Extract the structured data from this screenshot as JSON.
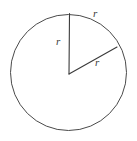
{
  "figure": {
    "kind": "geometry-diagram",
    "background_color": "#ffffff",
    "stroke_color": "#4a4a4a",
    "label_color": "#3b3b3b",
    "canvas": {
      "width": 137,
      "height": 141
    }
  },
  "circle": {
    "center_x": 68.5,
    "center_y": 72.5,
    "radius": 58,
    "stroke_width": 1,
    "stroke_color": "#4a4a4a",
    "fill": "none"
  },
  "radii": [
    {
      "name": "vertical-radius",
      "from_x": 69,
      "from_y": 74,
      "to_x": 69.5,
      "to_y": 13.5,
      "stroke_width": 1.1,
      "stroke_color": "#3a3a3a"
    },
    {
      "name": "diagonal-radius",
      "from_x": 69,
      "from_y": 74,
      "to_x": 117,
      "to_y": 47,
      "stroke_width": 1.1,
      "stroke_color": "#3a3a3a"
    }
  ],
  "labels": {
    "arc_label": "r",
    "vertical_radius_label": "r",
    "diagonal_radius_label": "r"
  },
  "chart_data": {
    "type": "diagram",
    "title": "",
    "shapes": [
      "circle",
      "radius",
      "radius"
    ],
    "annotations": [
      "r",
      "r",
      "r"
    ]
  }
}
